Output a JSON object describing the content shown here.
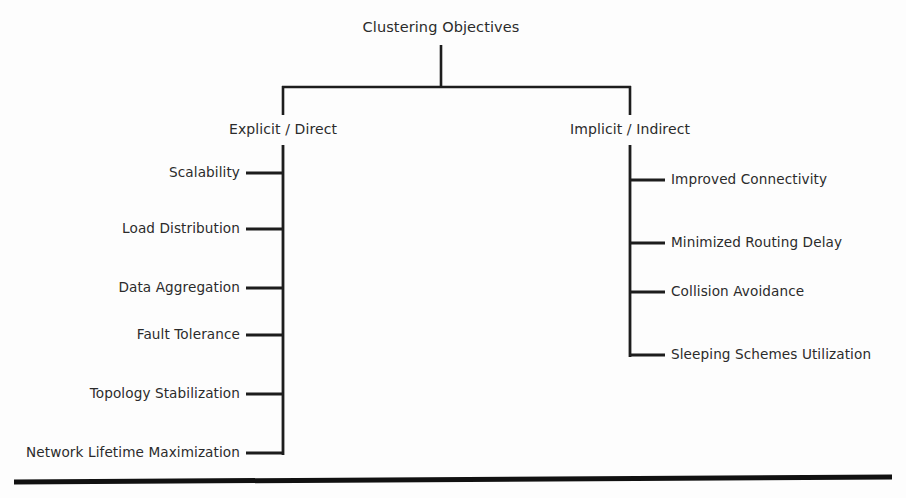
{
  "diagram": {
    "type": "tree-hierarchy",
    "title": "Clustering Objectives",
    "colors": {
      "line": "#1d1d1d",
      "text": "#2b2b2b",
      "background": "#fdfdfd",
      "rule": "#111111"
    },
    "root": {
      "label": "Clustering Objectives",
      "x": 441,
      "y": 28
    },
    "branches": [
      {
        "id": "explicit",
        "label": "Explicit / Direct",
        "x": 283,
        "y": 130,
        "side": "left",
        "children": [
          {
            "label": "Scalability",
            "y": 173
          },
          {
            "label": "Load Distribution",
            "y": 229
          },
          {
            "label": "Data Aggregation",
            "y": 288
          },
          {
            "label": "Fault Tolerance",
            "y": 335
          },
          {
            "label": "Topology Stabilization",
            "y": 394
          },
          {
            "label": "Network Lifetime Maximization",
            "y": 453
          }
        ]
      },
      {
        "id": "implicit",
        "label": "Implicit / Indirect",
        "x": 630,
        "y": 130,
        "side": "right",
        "children": [
          {
            "label": "Improved Connectivity",
            "y": 180
          },
          {
            "label": "Minimized Routing Delay",
            "y": 243
          },
          {
            "label": "Collision Avoidance",
            "y": 292
          },
          {
            "label": "Sleeping Schemes Utilization",
            "y": 355
          }
        ]
      }
    ],
    "connector": {
      "trunk_x": 441,
      "trunk_top_y": 45,
      "crossbar_y": 87,
      "crossbar_left_x": 283,
      "crossbar_right_x": 630,
      "branch_stem_bottom_y": 115,
      "left_spine_top_y": 145,
      "left_spine_bottom_y": 455,
      "right_spine_top_y": 145,
      "right_spine_bottom_y": 357,
      "left_stub_start_x": 246,
      "right_stub_end_x": 665
    },
    "footer_rule": {
      "x1": 14,
      "y1": 482,
      "x2": 892,
      "y2": 477,
      "thickness": 5
    }
  }
}
